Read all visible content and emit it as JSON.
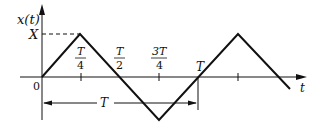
{
  "figure": {
    "y_axis_label": "x(t)",
    "x_axis_label": "t",
    "amplitude_label": "X",
    "origin_label": "0",
    "ticks": [
      {
        "num": "T",
        "den": "4"
      },
      {
        "num": "T",
        "den": "2"
      },
      {
        "num": "3T",
        "den": "4"
      }
    ],
    "period_tick_label": "T",
    "period_span_label": "T"
  },
  "waveform": {
    "type": "triangle",
    "points_in_periods": [
      [
        0,
        0
      ],
      [
        0.25,
        1
      ],
      [
        0.75,
        -1
      ],
      [
        1.25,
        1
      ],
      [
        1.5,
        0
      ]
    ],
    "amplitude": "X",
    "period": "T"
  },
  "colors": {
    "ink": "#111111",
    "background": "#ffffff"
  }
}
